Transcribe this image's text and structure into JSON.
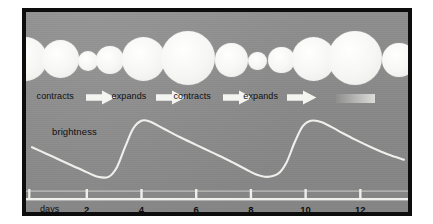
{
  "figure": {
    "type": "cepheid-variable-star-pulsation-diagram",
    "background_color": "#8f8f8f",
    "border_color": "#0d0d0d",
    "ink_color": "#f2f2ef",
    "text_color": "#0f0f0f"
  },
  "labels": {
    "brightness": "brightness",
    "days": "days",
    "contracts": "contracts",
    "expands": "expands"
  },
  "arrows": [
    {
      "label": "contracts",
      "x": 16,
      "y": 78,
      "width": 92
    },
    {
      "label": "expands",
      "x": 130,
      "y": 78,
      "width": 90
    },
    {
      "label": "contracts",
      "x": 224,
      "y": 78,
      "width": 92
    },
    {
      "label": "expands",
      "x": 330,
      "y": 78,
      "width": 90
    }
  ],
  "faded_arrow": {
    "x": 470,
    "y": 82,
    "width": 60,
    "height": 9
  },
  "stars": [
    {
      "cx": -2,
      "cy": 47,
      "r": 24
    },
    {
      "cx": 52,
      "cy": 47,
      "r": 20
    },
    {
      "cx": 94,
      "cy": 49,
      "r": 11
    },
    {
      "cx": 128,
      "cy": 48,
      "r": 15
    },
    {
      "cx": 178,
      "cy": 47,
      "r": 23
    },
    {
      "cx": 246,
      "cy": 46,
      "r": 29
    },
    {
      "cx": 312,
      "cy": 48,
      "r": 18
    },
    {
      "cx": 352,
      "cy": 49,
      "r": 10
    },
    {
      "cx": 388,
      "cy": 48,
      "r": 14
    },
    {
      "cx": 436,
      "cy": 47,
      "r": 23
    },
    {
      "cx": 500,
      "cy": 46,
      "r": 29
    },
    {
      "cx": 566,
      "cy": 48,
      "r": 18
    }
  ],
  "chart_data": {
    "type": "line",
    "title": "",
    "xlabel": "days",
    "ylabel": "brightness",
    "xlim": [
      0,
      13.6
    ],
    "ylim": [
      0,
      1
    ],
    "grid": false,
    "legend": "none",
    "tick_values": [
      2,
      4,
      6,
      8,
      10,
      12
    ],
    "tick_labels": [
      "2",
      "4",
      "6",
      "8",
      "10",
      "12"
    ],
    "series": [
      {
        "name": "brightness",
        "color": "#efefec",
        "x": [
          0.0,
          0.5,
          1.0,
          1.5,
          2.0,
          2.4,
          2.8,
          3.1,
          3.4,
          3.7,
          4.0,
          4.3,
          4.8,
          5.4,
          6.0,
          6.6,
          7.2,
          7.8,
          8.2,
          8.6,
          9.0,
          9.3,
          9.6,
          9.9,
          10.2,
          10.6,
          11.2,
          11.8,
          12.4,
          13.0,
          13.6
        ],
        "y": [
          0.6,
          0.52,
          0.44,
          0.36,
          0.28,
          0.22,
          0.22,
          0.34,
          0.6,
          0.84,
          0.94,
          0.93,
          0.84,
          0.73,
          0.63,
          0.53,
          0.43,
          0.32,
          0.25,
          0.22,
          0.26,
          0.4,
          0.66,
          0.87,
          0.94,
          0.92,
          0.81,
          0.7,
          0.6,
          0.51,
          0.44
        ]
      }
    ]
  },
  "axis": {
    "baseline_y": 186,
    "tick_height": 9,
    "color": "#efefec"
  }
}
